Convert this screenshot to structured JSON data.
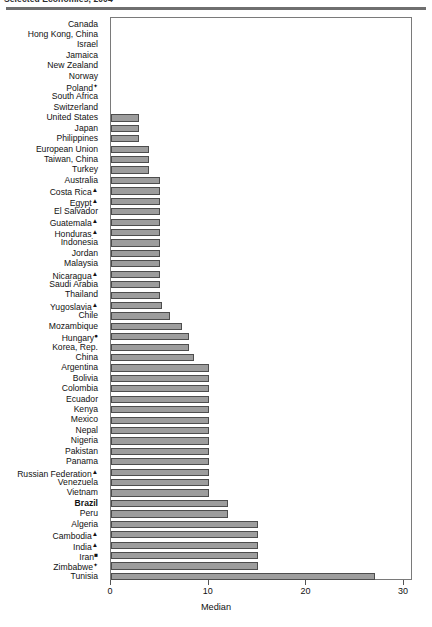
{
  "title": "Selected Economies, 2004",
  "chart_data": {
    "type": "bar",
    "orientation": "horizontal",
    "title": "Selected Economies, 2004",
    "xlabel": "Median",
    "ylabel": "",
    "xlim": [
      0,
      31
    ],
    "xticks": [
      0,
      10,
      20,
      30
    ],
    "xtick_labels": [
      "0",
      "10",
      "20",
      "30"
    ],
    "grid": false,
    "legend": false,
    "bar_color": "#9d9d9d",
    "bar_edge_color": "#4d4d4d",
    "categories": [
      "Canada",
      "Hong Kong, China",
      "Israel",
      "Jamaica",
      "New Zealand",
      "Norway",
      "Poland",
      "South Africa",
      "Switzerland",
      "United States",
      "Japan",
      "Philippines",
      "European Union",
      "Taiwan, China",
      "Turkey",
      "Australia",
      "Costa Rica",
      "Egypt",
      "El Salvador",
      "Guatemala",
      "Honduras",
      "Indonesia",
      "Jordan",
      "Malaysia",
      "Nicaragua",
      "Saudi Arabia",
      "Thailand",
      "Yugoslavia",
      "Chile",
      "Mozambique",
      "Hungary",
      "Korea, Rep.",
      "China",
      "Argentina",
      "Bolivia",
      "Colombia",
      "Ecuador",
      "Kenya",
      "Mexico",
      "Nepal",
      "Nigeria",
      "Pakistan",
      "Panama",
      "Russian Federation",
      "Venezuela",
      "Vietnam",
      "Brazil",
      "Peru",
      "Algeria",
      "Cambodia",
      "India",
      "Iran",
      "Zimbabwe",
      "Tunisia"
    ],
    "values": [
      0,
      0,
      0,
      0,
      0,
      0,
      0,
      0,
      0,
      2.9,
      2.9,
      2.9,
      3.9,
      3.9,
      3.9,
      5.0,
      5.0,
      5.0,
      5.0,
      5.0,
      5.0,
      5.0,
      5.0,
      5.0,
      5.0,
      5.0,
      5.0,
      5.2,
      6.0,
      7.3,
      8.0,
      8.0,
      8.5,
      10.0,
      10.0,
      10.0,
      10.0,
      10.0,
      10.0,
      10.0,
      10.0,
      10.0,
      10.0,
      10.0,
      10.0,
      10.0,
      12.0,
      12.0,
      15.0,
      15.0,
      15.0,
      15.0,
      15.0,
      27.0
    ],
    "markers": [
      "",
      "",
      "",
      "",
      "",
      "",
      "✦",
      "",
      "",
      "",
      "",
      "",
      "",
      "",
      "",
      "",
      "▲",
      "▲",
      "",
      "▲",
      "▲",
      "",
      "",
      "",
      "▲",
      "",
      "",
      "▲",
      "",
      "",
      "●",
      "",
      "",
      "",
      "",
      "",
      "",
      "",
      "",
      "",
      "",
      "",
      "",
      "▲",
      "",
      "",
      "",
      "",
      "",
      "▲",
      "▲",
      "■",
      "✦",
      ""
    ],
    "bold_labels": [
      "Brazil"
    ]
  }
}
